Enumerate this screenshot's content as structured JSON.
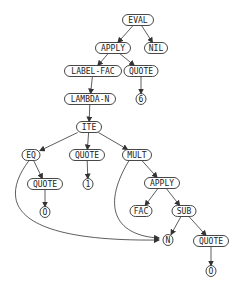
{
  "diagram": {
    "type": "tree-graph",
    "nodes": [
      {
        "id": "eval",
        "label": "EVAL",
        "x": 138,
        "y": 20,
        "w": 31
      },
      {
        "id": "apply1",
        "label": "APPLY",
        "x": 113,
        "y": 48,
        "w": 35
      },
      {
        "id": "nil",
        "label": "NIL",
        "x": 156,
        "y": 48,
        "w": 23
      },
      {
        "id": "labelfac",
        "label": "LABEL-FAC",
        "x": 93,
        "y": 71,
        "w": 57
      },
      {
        "id": "quote1",
        "label": "QUOTE",
        "x": 141,
        "y": 71,
        "w": 34
      },
      {
        "id": "lambdan",
        "label": "LAMBDA-N",
        "x": 90,
        "y": 99,
        "w": 51
      },
      {
        "id": "six",
        "label": "6",
        "x": 141,
        "y": 99,
        "w": 10
      },
      {
        "id": "ite",
        "label": "ITE",
        "x": 89,
        "y": 127,
        "w": 25
      },
      {
        "id": "eq",
        "label": "EQ",
        "x": 31,
        "y": 155,
        "w": 18
      },
      {
        "id": "quote2",
        "label": "QUOTE",
        "x": 87,
        "y": 155,
        "w": 35
      },
      {
        "id": "mult",
        "label": "MULT",
        "x": 137,
        "y": 155,
        "w": 29
      },
      {
        "id": "quote3",
        "label": "QUOTE",
        "x": 45,
        "y": 184,
        "w": 35
      },
      {
        "id": "one",
        "label": "1",
        "x": 88,
        "y": 184,
        "w": 10
      },
      {
        "id": "apply2",
        "label": "APPLY",
        "x": 162,
        "y": 183,
        "w": 35
      },
      {
        "id": "zero1",
        "label": "O",
        "x": 45,
        "y": 212,
        "w": 10
      },
      {
        "id": "fac",
        "label": "FAC",
        "x": 141,
        "y": 211,
        "w": 22
      },
      {
        "id": "sub",
        "label": "SUB",
        "x": 184,
        "y": 211,
        "w": 24
      },
      {
        "id": "n",
        "label": "N",
        "x": 168,
        "y": 240,
        "w": 10
      },
      {
        "id": "quote4",
        "label": "QUOTE",
        "x": 211,
        "y": 241,
        "w": 35
      },
      {
        "id": "zero2",
        "label": "O",
        "x": 211,
        "y": 271,
        "w": 10
      }
    ],
    "edges": [
      {
        "from": "eval",
        "to": "apply1"
      },
      {
        "from": "eval",
        "to": "nil"
      },
      {
        "from": "apply1",
        "to": "labelfac"
      },
      {
        "from": "apply1",
        "to": "quote1"
      },
      {
        "from": "labelfac",
        "to": "lambdan"
      },
      {
        "from": "quote1",
        "to": "six"
      },
      {
        "from": "lambdan",
        "to": "ite"
      },
      {
        "from": "ite",
        "to": "eq"
      },
      {
        "from": "ite",
        "to": "quote2"
      },
      {
        "from": "ite",
        "to": "mult"
      },
      {
        "from": "eq",
        "to": "quote3"
      },
      {
        "from": "eq",
        "to": "n",
        "curved": true
      },
      {
        "from": "quote3",
        "to": "zero1"
      },
      {
        "from": "quote2",
        "to": "one"
      },
      {
        "from": "mult",
        "to": "apply2"
      },
      {
        "from": "mult",
        "to": "n",
        "curved": true
      },
      {
        "from": "apply2",
        "to": "fac"
      },
      {
        "from": "apply2",
        "to": "sub"
      },
      {
        "from": "sub",
        "to": "n"
      },
      {
        "from": "sub",
        "to": "quote4"
      },
      {
        "from": "quote4",
        "to": "zero2"
      }
    ]
  }
}
